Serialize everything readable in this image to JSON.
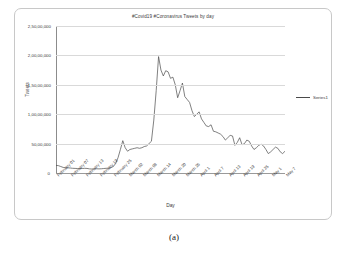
{
  "figure": {
    "caption": "(a)",
    "legend": {
      "series_label": "Series1",
      "position": "right",
      "color": "#4a4a4a"
    }
  },
  "chart_data": {
    "type": "line",
    "title": "#Covid19 #Coronavirus Tweets by day",
    "xlabel": "Day",
    "ylabel": "Tweets",
    "grid": true,
    "ylim": [
      0,
      25000000
    ],
    "ytick_labels": [
      "2,50,00,000",
      "2,00,00,000",
      "1,50,00,000",
      "1,00,00,000",
      "50,00,000",
      "0"
    ],
    "ytick_values": [
      25000000,
      20000000,
      15000000,
      10000000,
      5000000,
      0
    ],
    "xtick_labels": [
      "February 01",
      "February 07",
      "February 13",
      "February 19",
      "February 25",
      "March 02",
      "March 08",
      "March 14",
      "March 20",
      "March 26",
      "April 1",
      "April 7",
      "April 13",
      "April 19",
      "April 25",
      "May 1",
      "May 7"
    ],
    "xtick_indices": [
      0,
      6,
      12,
      18,
      24,
      30,
      36,
      42,
      48,
      54,
      60,
      66,
      72,
      78,
      84,
      90,
      96
    ],
    "series": [
      {
        "name": "Series1",
        "x": [
          "February 01",
          "February 02",
          "February 03",
          "February 04",
          "February 05",
          "February 06",
          "February 07",
          "February 08",
          "February 09",
          "February 10",
          "February 11",
          "February 12",
          "February 13",
          "February 14",
          "February 15",
          "February 16",
          "February 17",
          "February 18",
          "February 19",
          "February 20",
          "February 21",
          "February 22",
          "February 23",
          "February 24",
          "February 25",
          "February 26",
          "February 27",
          "February 28",
          "February 29",
          "March 01",
          "March 02",
          "March 03",
          "March 04",
          "March 05",
          "March 06",
          "March 07",
          "March 08",
          "March 09",
          "March 10",
          "March 11",
          "March 12",
          "March 13",
          "March 14",
          "March 15",
          "March 16",
          "March 17",
          "March 18",
          "March 19",
          "March 20",
          "March 21",
          "March 22",
          "March 23",
          "March 24",
          "March 25",
          "March 26",
          "March 27",
          "March 28",
          "March 29",
          "March 30",
          "March 31",
          "April 1",
          "April 2",
          "April 3",
          "April 4",
          "April 5",
          "April 6",
          "April 7",
          "April 8",
          "April 9",
          "April 10",
          "April 11",
          "April 12",
          "April 13",
          "April 14",
          "April 15",
          "April 16",
          "April 17",
          "April 18",
          "April 19",
          "April 20",
          "April 21",
          "April 22",
          "April 23",
          "April 24",
          "April 25",
          "April 26",
          "April 27",
          "April 28",
          "April 29",
          "April 30",
          "May 1",
          "May 2",
          "May 3",
          "May 4",
          "May 5",
          "May 6",
          "May 7"
        ],
        "values": [
          1300000,
          1250000,
          1100000,
          950000,
          900000,
          880000,
          850000,
          800000,
          780000,
          760000,
          740000,
          760000,
          800000,
          780000,
          700000,
          680000,
          700000,
          720000,
          700000,
          720000,
          760000,
          800000,
          820000,
          900000,
          1100000,
          1600000,
          2600000,
          4000000,
          5500000,
          4300000,
          3700000,
          4000000,
          4100000,
          4200000,
          4300000,
          4200000,
          4300000,
          4500000,
          4600000,
          5000000,
          5400000,
          9000000,
          14000000,
          19800000,
          17500000,
          16500000,
          17400000,
          17200000,
          16100000,
          16300000,
          15000000,
          12800000,
          14000000,
          15300000,
          13000000,
          12500000,
          12000000,
          10600000,
          9600000,
          10000000,
          10400000,
          9200000,
          8600000,
          8000000,
          7900000,
          8200000,
          7100000,
          7000000,
          6800000,
          6600000,
          6200000,
          5600000,
          6000000,
          6400000,
          6300000,
          4700000,
          5200000,
          6000000,
          4800000,
          5000000,
          5600000,
          5400000,
          4600000,
          4000000,
          4300000,
          4700000,
          4900000,
          4600000,
          4000000,
          3300000,
          3600000,
          4000000,
          4400000,
          4200000,
          3600000,
          3300000,
          3700000
        ]
      }
    ]
  }
}
